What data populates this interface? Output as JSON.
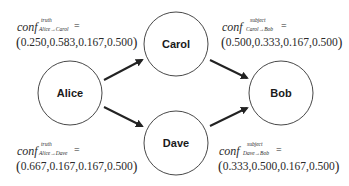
{
  "diagram": {
    "type": "directed-graph",
    "nodes": [
      {
        "id": "alice",
        "label": "Alice",
        "cx": 70,
        "cy": 93,
        "r": 32
      },
      {
        "id": "carol",
        "label": "Carol",
        "cx": 176,
        "cy": 44,
        "r": 32
      },
      {
        "id": "dave",
        "label": "Dave",
        "cx": 176,
        "cy": 143,
        "r": 32
      },
      {
        "id": "bob",
        "label": "Bob",
        "cx": 281,
        "cy": 93,
        "r": 32
      }
    ],
    "edges": [
      {
        "from": "alice",
        "to": "carol"
      },
      {
        "from": "alice",
        "to": "dave"
      },
      {
        "from": "carol",
        "to": "bob"
      },
      {
        "from": "dave",
        "to": "bob"
      }
    ],
    "colors": {
      "stroke": "#222222",
      "background": "#ffffff",
      "text": "#1a1a1a"
    }
  },
  "annotations": {
    "alice_carol": {
      "prefix": "conf",
      "superscript": "truth",
      "subscript": "Alice→Carol",
      "equals": "=",
      "values": "0.250,0.583,0.167,0.500",
      "open_paren": "(",
      "close_paren": ")"
    },
    "carol_bob": {
      "prefix": "conf",
      "superscript": "subject",
      "subscript": "Carol→Bob",
      "equals": "=",
      "values": "0.500,0.333,0.167,0.500",
      "open_paren": "(",
      "close_paren": ")"
    },
    "alice_dave": {
      "prefix": "conf",
      "superscript": "truth",
      "subscript": "Alice→Dave",
      "equals": "=",
      "values": "0.667,0.167,0.167,0.500",
      "open_paren": "(",
      "close_paren": ")"
    },
    "dave_bob": {
      "prefix": "conf",
      "superscript": "subject",
      "subscript": "Dave→Bob",
      "equals": "=",
      "values": "0.333,0.500,0.167,0.500",
      "open_paren": "(",
      "close_paren": ")"
    }
  }
}
